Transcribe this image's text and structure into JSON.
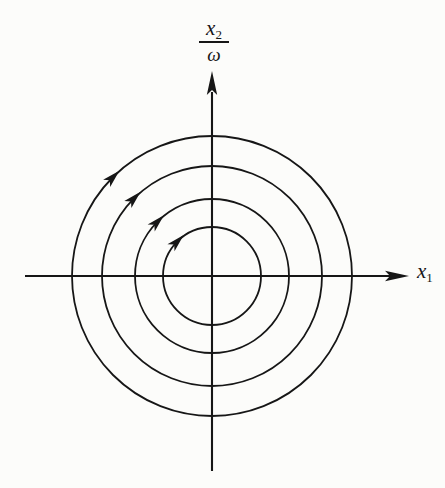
{
  "figure": {
    "type": "phase-portrait",
    "background_color": "#fcfcfa",
    "line_color": "#161616",
    "y_axis_label": {
      "base": "x",
      "subscript": "2",
      "denominator": "ω"
    },
    "x_axis_label": {
      "base": "x",
      "subscript": "1"
    },
    "trajectories": {
      "shape": "concentric-circles",
      "center": {
        "x": 212,
        "y": 276
      },
      "radii": [
        49,
        77,
        110,
        140
      ],
      "direction": "clockwise",
      "arrow_position_angle_deg": 135
    }
  }
}
